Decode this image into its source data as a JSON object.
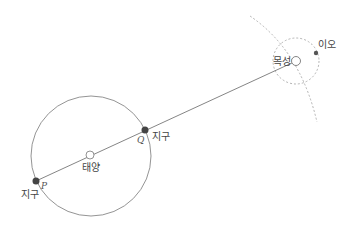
{
  "diagram": {
    "labels": {
      "sun": "태양",
      "earth_p": "지구",
      "earth_q": "지구",
      "jupiter": "목성",
      "io": "이오",
      "point_p": "P",
      "point_q": "Q"
    },
    "colors": {
      "line": "#777777",
      "earth": "#444444",
      "io": "#555555",
      "dotted": "#aaaaaa"
    }
  }
}
